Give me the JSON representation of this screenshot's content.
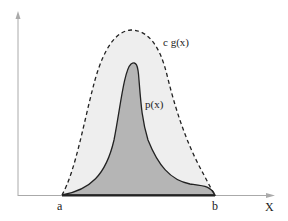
{
  "diagram": {
    "labels": {
      "envelope": "c g(x)",
      "target": "p(x)",
      "a": "a",
      "b": "b",
      "x_axis": "X"
    },
    "colors": {
      "envelope_fill": "#eeeeee",
      "target_fill": "#b5b5b5",
      "curve_stroke": "#222222",
      "axis": "#aaaaaa"
    }
  }
}
